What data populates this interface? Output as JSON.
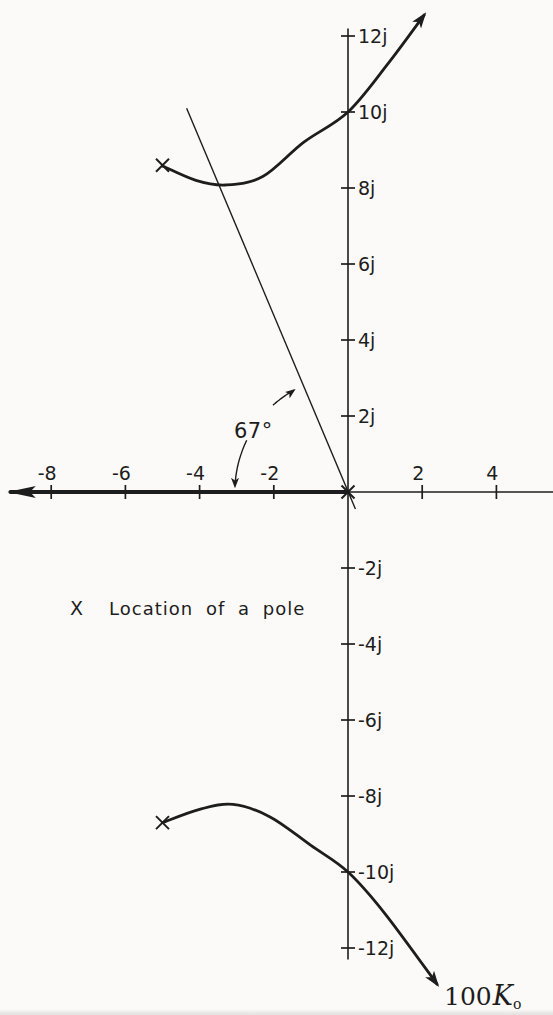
{
  "colors": {
    "ink": "#1d1d1d",
    "paper": "#fbfaf8"
  },
  "chart_data": {
    "type": "line",
    "subtype": "root-locus-s-plane",
    "grid": false,
    "x_axis": {
      "min": -9.1,
      "max": 5.5,
      "arrow": "left-end",
      "ticks": [
        {
          "v": -8,
          "label": "-8"
        },
        {
          "v": -6,
          "label": "-6"
        },
        {
          "v": -4,
          "label": "-4"
        },
        {
          "v": -2,
          "label": "-2"
        },
        {
          "v": 2,
          "label": "2"
        },
        {
          "v": 4,
          "label": "4"
        }
      ]
    },
    "y_axis": {
      "min": -12.3,
      "max": 12.2,
      "ticks": [
        {
          "v": 12,
          "label": "12j"
        },
        {
          "v": 10,
          "label": "10j"
        },
        {
          "v": 8,
          "label": "8j"
        },
        {
          "v": 6,
          "label": "6j"
        },
        {
          "v": 4,
          "label": "4j"
        },
        {
          "v": 2,
          "label": "2j"
        },
        {
          "v": -2,
          "label": "-2j"
        },
        {
          "v": -4,
          "label": "-4j"
        },
        {
          "v": -6,
          "label": "-6j"
        },
        {
          "v": -8,
          "label": "-8j"
        },
        {
          "v": -10,
          "label": "-10j"
        },
        {
          "v": -12,
          "label": "-12j"
        }
      ]
    },
    "poles": [
      {
        "re": -5,
        "im": 8.6
      },
      {
        "re": 0,
        "im": 0
      },
      {
        "re": -5,
        "im": -8.7
      }
    ],
    "branches": [
      {
        "name": "upper-complex-branch",
        "points": [
          [
            -5,
            8.58
          ],
          [
            -4.1,
            8.2
          ],
          [
            -3.3,
            8.08
          ],
          [
            -2.3,
            8.3
          ],
          [
            -1.2,
            9.2
          ],
          [
            0,
            10
          ],
          [
            1.1,
            11.3
          ],
          [
            2.05,
            12.55
          ]
        ],
        "arrow_at_end": true,
        "bold": false
      },
      {
        "name": "lower-complex-branch",
        "points": [
          [
            -5,
            -8.7
          ],
          [
            -4.0,
            -8.35
          ],
          [
            -3.1,
            -8.22
          ],
          [
            -2.1,
            -8.55
          ],
          [
            -1.0,
            -9.3
          ],
          [
            0,
            -10
          ],
          [
            1.0,
            -11.1
          ],
          [
            2.4,
            -12.95
          ]
        ],
        "arrow_at_end": true,
        "bold": false
      },
      {
        "name": "real-axis-branch",
        "points": [
          [
            0,
            0
          ],
          [
            -9.1,
            0
          ]
        ],
        "arrow_at_end": true,
        "bold": true
      }
    ],
    "jw_axis_crossings": [
      [
        0,
        10
      ],
      [
        0,
        -10
      ]
    ],
    "asymptote": {
      "from": [
        -4.35,
        10.1
      ],
      "to": [
        0.2,
        -0.45
      ]
    },
    "angle_annotation": {
      "label": "67°",
      "vertex": [
        0,
        0
      ],
      "radius": 3.05,
      "arc_from_deg": 118.5,
      "arc_to_deg": 177.2,
      "gap_from_deg": 131.5,
      "gap_to_deg": 153.5
    },
    "legend": {
      "marker": "X",
      "text": "Location of a pole"
    },
    "gain_label": {
      "value": "100",
      "symbol": "K",
      "subscript": "o"
    }
  }
}
